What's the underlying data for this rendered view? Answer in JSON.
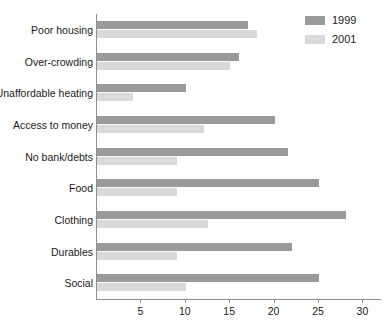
{
  "chart_data": {
    "type": "bar",
    "orientation": "horizontal",
    "title": "",
    "xlabel": "",
    "ylabel": "",
    "xlim": [
      0,
      30
    ],
    "ylim": null,
    "grid": false,
    "legend_position": "top-right",
    "categories": [
      "Poor housing",
      "Over-crowding",
      "Unaffordable heating",
      "Access to money",
      "No bank/debts",
      "Food",
      "Clothing",
      "Durables",
      "Social"
    ],
    "xticks": [
      5,
      10,
      15,
      20,
      25,
      30
    ],
    "xtick_labels": [
      "5",
      "10",
      "15",
      "20",
      "25",
      "30"
    ],
    "series": [
      {
        "name": "1999",
        "color": "#9a9a9a",
        "values": [
          17,
          16,
          10,
          20,
          21.5,
          25,
          28,
          22,
          25
        ]
      },
      {
        "name": "2001",
        "color": "#d9d9d9",
        "values": [
          18,
          15,
          4,
          12,
          9,
          9,
          12.5,
          9,
          10
        ]
      }
    ]
  },
  "legend": {
    "entries": [
      {
        "label": "1999",
        "swatch_color": "#9a9a9a"
      },
      {
        "label": "2001",
        "swatch_color": "#d9d9d9"
      }
    ]
  },
  "axis": {
    "line_color": "#8e8e8e"
  }
}
